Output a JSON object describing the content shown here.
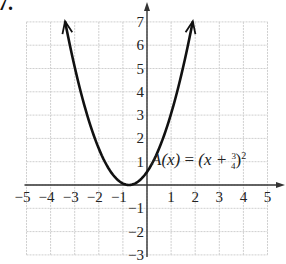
{
  "problem_label": "7.",
  "chart_data": {
    "type": "line",
    "title": "",
    "function_label": "A(x) = (x + 3/4)^2",
    "function_label_parts": {
      "lhs": "A(x)",
      "eq": "=",
      "open": "(x +",
      "num": "3",
      "den": "4",
      "close": ")",
      "exp": "2"
    },
    "xlabel": "",
    "ylabel": "",
    "xlim": [
      -5,
      5
    ],
    "ylim": [
      -3,
      7
    ],
    "x_ticks": [
      -5,
      -4,
      -3,
      -2,
      -1,
      1,
      2,
      3,
      4,
      5
    ],
    "y_ticks": [
      -3,
      -2,
      -1,
      1,
      2,
      3,
      4,
      5,
      6,
      7
    ],
    "grid": true,
    "vertex": [
      -0.75,
      0
    ],
    "series": [
      {
        "name": "A(x)",
        "x": [
          -3.4,
          -3,
          -2.5,
          -2,
          -1.5,
          -1,
          -0.75,
          -0.5,
          0,
          0.5,
          1,
          1.5,
          1.9
        ],
        "y": [
          7.02,
          5.06,
          3.06,
          1.56,
          0.56,
          0.06,
          0,
          0.06,
          0.56,
          1.56,
          3.06,
          5.06,
          7.02
        ]
      }
    ],
    "arrows": "both ends"
  },
  "colors": {
    "grid": "#cfcfcf",
    "axis": "#333333",
    "curve": "#111111"
  }
}
